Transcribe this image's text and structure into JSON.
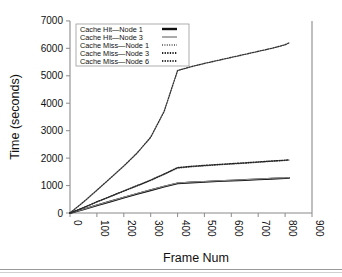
{
  "chart_data": {
    "type": "line",
    "title": "",
    "xlabel": "Frame Num",
    "ylabel": "Time (seconds)",
    "xlim": [
      0,
      900
    ],
    "ylim": [
      0,
      7000
    ],
    "xticks": [
      0,
      100,
      200,
      300,
      400,
      500,
      600,
      700,
      800,
      900
    ],
    "xticklabels": [
      "0",
      "100",
      "200",
      "300",
      "400",
      "500",
      "600",
      "700",
      "800",
      "900"
    ],
    "yticks": [
      0,
      1000,
      2000,
      3000,
      4000,
      5000,
      6000,
      7000
    ],
    "yticklabels": [
      "0",
      "1000",
      "2000",
      "3000",
      "4000",
      "5000",
      "6000",
      "7000"
    ],
    "grid": false,
    "legend_position": "upper-left",
    "x": [
      0,
      50,
      100,
      150,
      200,
      250,
      300,
      350,
      400,
      450,
      500,
      550,
      600,
      650,
      700,
      750,
      800,
      815
    ],
    "series": [
      {
        "name": "Cache Hit—Node 1",
        "style": "solid-thick",
        "color": "#111111",
        "values": [
          0,
          130,
          280,
          420,
          560,
          700,
          830,
          960,
          1080,
          1110,
          1135,
          1160,
          1180,
          1200,
          1225,
          1250,
          1270,
          1280
        ]
      },
      {
        "name": "Cache Hit—Node 3",
        "style": "solid-thin-gray",
        "color": "#8f8f8f",
        "values": [
          0,
          135,
          290,
          430,
          575,
          715,
          845,
          975,
          1095,
          1125,
          1150,
          1175,
          1195,
          1215,
          1240,
          1265,
          1282,
          1292
        ]
      },
      {
        "name": "Cache Miss—Node 1",
        "style": "dotted-fine",
        "color": "#4a4a4a",
        "values": [
          0,
          190,
          400,
          590,
          790,
          980,
          1180,
          1400,
          1630,
          1680,
          1715,
          1750,
          1780,
          1810,
          1845,
          1880,
          1910,
          1925
        ]
      },
      {
        "name": "Cache Miss—Node 3",
        "style": "dotted",
        "color": "#222222",
        "values": [
          0,
          195,
          410,
          605,
          805,
          1000,
          1200,
          1420,
          1655,
          1700,
          1735,
          1768,
          1798,
          1828,
          1862,
          1895,
          1925,
          1940
        ]
      },
      {
        "name": "Cache Miss—Node 6",
        "style": "dotted",
        "color": "#333333",
        "values": [
          0,
          400,
          830,
          1270,
          1710,
          2190,
          2760,
          3700,
          5190,
          5330,
          5450,
          5560,
          5670,
          5780,
          5890,
          6000,
          6130,
          6200
        ]
      }
    ]
  },
  "legend": {
    "items": [
      {
        "label": "Cache Hit—Node 1"
      },
      {
        "label": "Cache Hit—Node 3"
      },
      {
        "label": "Cache Miss—Node 1"
      },
      {
        "label": "Cache Miss—Node 3"
      },
      {
        "label": "Cache Miss—Node 6"
      }
    ]
  }
}
